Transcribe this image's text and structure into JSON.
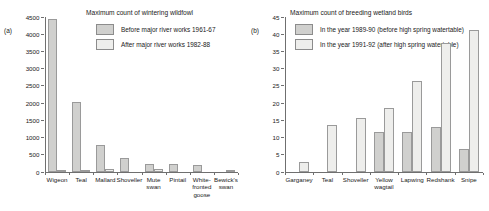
{
  "figure": {
    "panels": [
      {
        "tag": "(a)",
        "title": "Maximum count of wintering wildfowl",
        "legend": [
          {
            "label": "Before major river works 1961-67",
            "swatch": "dark",
            "color": "#d0d0ce"
          },
          {
            "label": "After major river works 1982-88",
            "swatch": "light",
            "color": "#eeeeec"
          }
        ]
      },
      {
        "tag": "(b)",
        "title": "Maximum count of breeding wetland birds",
        "legend": [
          {
            "label": "In the year 1989-90 (before high spring watertable)",
            "swatch": "dark",
            "color": "#d0d0ce"
          },
          {
            "label": "In the year 1991-92 (after high spring watertable)",
            "swatch": "light",
            "color": "#eeeeec"
          }
        ]
      }
    ]
  },
  "chart_data": [
    {
      "type": "bar",
      "panel": "(a)",
      "title": "Maximum count of wintering wildfowl",
      "xlabel": "",
      "ylabel": "",
      "ylim": [
        0,
        4500
      ],
      "ytick_step": 500,
      "yticks": [
        0,
        500,
        1000,
        1500,
        2000,
        2500,
        3000,
        3500,
        4000,
        4500
      ],
      "grid": false,
      "legend_position": "top-right",
      "categories": [
        "Wigeon",
        "Teal",
        "Mallard",
        "Shoveller",
        "Mute\nswan",
        "Pintail",
        "White-\nfronted\ngoose",
        "Bewick's\nswan"
      ],
      "series": [
        {
          "name": "Before major river works 1961-67",
          "color": "#d0d0ce",
          "values": [
            4450,
            2030,
            790,
            400,
            220,
            220,
            200,
            0
          ]
        },
        {
          "name": "After major river works 1982-88",
          "color": "#eeeeec",
          "values": [
            50,
            50,
            100,
            0,
            100,
            0,
            0,
            60
          ]
        }
      ]
    },
    {
      "type": "bar",
      "panel": "(b)",
      "title": "Maximum count of breeding wetland birds",
      "xlabel": "",
      "ylabel": "",
      "ylim": [
        0,
        45
      ],
      "ytick_step": 5,
      "yticks": [
        0,
        5,
        10,
        15,
        20,
        25,
        30,
        35,
        40,
        45
      ],
      "grid": false,
      "legend_position": "top-right",
      "categories": [
        "Garganey",
        "Teal",
        "Shoveller",
        "Yellow\nwagtail",
        "Lapwing",
        "Redshank",
        "Snipe"
      ],
      "series": [
        {
          "name": "In the year 1989-90 (before high spring watertable)",
          "color": "#d0d0ce",
          "values": [
            0,
            0,
            0,
            11.7,
            11.7,
            13.1,
            6.6
          ]
        },
        {
          "name": "In the year 1991-92 (after high spring watertable)",
          "color": "#eeeeec",
          "values": [
            3.0,
            13.7,
            15.6,
            18.6,
            26.3,
            37.5,
            41.3
          ]
        }
      ]
    }
  ]
}
